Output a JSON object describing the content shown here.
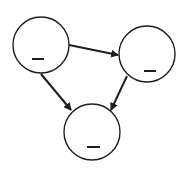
{
  "diagram": {
    "type": "directed-graph",
    "stroke_color": "#1e1e1e",
    "fill_color": "#ffffff",
    "nodes": [
      {
        "id": "A",
        "label": "_",
        "cx": 41,
        "cy": 45,
        "r": 28,
        "dash": {
          "x1": 32,
          "x2": 44,
          "y": 59
        }
      },
      {
        "id": "B",
        "label": "_",
        "cx": 147,
        "cy": 54,
        "r": 28,
        "dash": {
          "x1": 144,
          "x2": 156,
          "y": 71
        }
      },
      {
        "id": "C",
        "label": "_",
        "cx": 92,
        "cy": 132,
        "r": 28,
        "dash": {
          "x1": 87,
          "x2": 100,
          "y": 147
        }
      }
    ],
    "edges": [
      {
        "from": "A",
        "to": "B",
        "x1": 69,
        "y1": 45,
        "x2": 118,
        "y2": 55
      },
      {
        "from": "A",
        "to": "C",
        "x1": 41,
        "y1": 74,
        "x2": 71,
        "y2": 110
      },
      {
        "from": "B",
        "to": "C",
        "x1": 127,
        "y1": 76,
        "x2": 111,
        "y2": 110
      }
    ]
  }
}
